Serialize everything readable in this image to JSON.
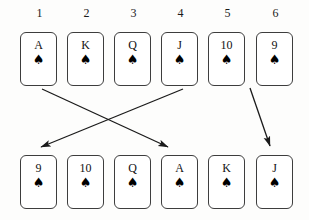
{
  "diagram": {
    "column_labels": [
      "1",
      "2",
      "3",
      "4",
      "5",
      "6"
    ],
    "suit_glyph": "♠",
    "suit_name": "spades",
    "line_color": "#1a1a1a",
    "card_border_color": "#3d3d3d",
    "card_face_color": "#ffffff",
    "background_color": "#fdfdfc"
  },
  "top_row": {
    "name": "original-order",
    "cards": [
      {
        "rank": "A",
        "suit": "♠",
        "column": "1"
      },
      {
        "rank": "K",
        "suit": "♠",
        "column": "2"
      },
      {
        "rank": "Q",
        "suit": "♠",
        "column": "3"
      },
      {
        "rank": "J",
        "suit": "♠",
        "column": "4"
      },
      {
        "rank": "10",
        "suit": "♠",
        "column": "5"
      },
      {
        "rank": "9",
        "suit": "♠",
        "column": "6"
      }
    ]
  },
  "bottom_row": {
    "name": "rearranged-order",
    "cards": [
      {
        "rank": "9",
        "suit": "♠",
        "column": "1"
      },
      {
        "rank": "10",
        "suit": "♠",
        "column": "2"
      },
      {
        "rank": "Q",
        "suit": "♠",
        "column": "3"
      },
      {
        "rank": "A",
        "suit": "♠",
        "column": "4"
      },
      {
        "rank": "K",
        "suit": "♠",
        "column": "5"
      },
      {
        "rank": "J",
        "suit": "♠",
        "column": "6"
      }
    ]
  },
  "arrows": [
    {
      "name": "arrow-a-to-position-4",
      "from_card": "A",
      "to_card": "A",
      "x1": 42,
      "y1": 89,
      "x2": 168,
      "y2": 147
    },
    {
      "name": "arrow-j-to-position-1",
      "from_card": "J",
      "to_card": "9",
      "x1": 183,
      "y1": 89,
      "x2": 41,
      "y2": 147
    },
    {
      "name": "arrow-9-to-position-6",
      "from_card": "9",
      "to_card": "J",
      "x1": 250,
      "y1": 88,
      "x2": 270,
      "y2": 146
    }
  ],
  "geometry": {
    "card_width": 37,
    "card_height": 54,
    "column_x": [
      20,
      67,
      114,
      161,
      208,
      256
    ],
    "label_y": 6,
    "top_row_y": 32,
    "bottom_row_y": 155
  }
}
